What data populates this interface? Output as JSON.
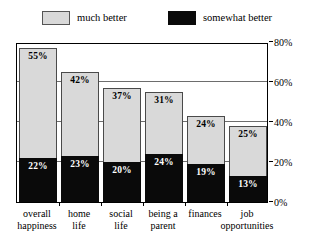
{
  "chart_data": {
    "type": "bar",
    "subtype": "stacked-bar",
    "title": "",
    "subtitle": "",
    "xlabel": "",
    "ylabel": "",
    "ylim": [
      0,
      80
    ],
    "yticks": [
      0,
      20,
      40,
      60,
      80
    ],
    "ytick_labels": [
      "0%",
      "20%",
      "40%",
      "60%",
      "80%"
    ],
    "grid": true,
    "grid_axis": "y",
    "legend_position": "top",
    "categories": [
      "overall happiness",
      "home life",
      "social life",
      "being a parent",
      "finances",
      "job opportunities"
    ],
    "category_lines": [
      [
        "overall",
        "happiness"
      ],
      [
        "home",
        "life"
      ],
      [
        "social",
        "life"
      ],
      [
        "being a",
        "parent"
      ],
      [
        "finances",
        ""
      ],
      [
        "job",
        "opportunities"
      ]
    ],
    "series": [
      {
        "name": "somewhat better",
        "color": "#0a0a0a",
        "values": [
          22,
          23,
          20,
          24,
          19,
          13
        ],
        "labels": [
          "22%",
          "23%",
          "20%",
          "24%",
          "19%",
          "13%"
        ]
      },
      {
        "name": "much better",
        "color": "#d9d9d9",
        "values": [
          55,
          42,
          37,
          31,
          24,
          25
        ],
        "labels": [
          "55%",
          "42%",
          "37%",
          "31%",
          "24%",
          "25%"
        ]
      }
    ],
    "totals": [
      77,
      65,
      57,
      55,
      43,
      38
    ]
  },
  "legend": {
    "items": [
      {
        "label": "much better",
        "color": "#d9d9d9"
      },
      {
        "label": "somewhat better",
        "color": "#0a0a0a"
      }
    ]
  }
}
